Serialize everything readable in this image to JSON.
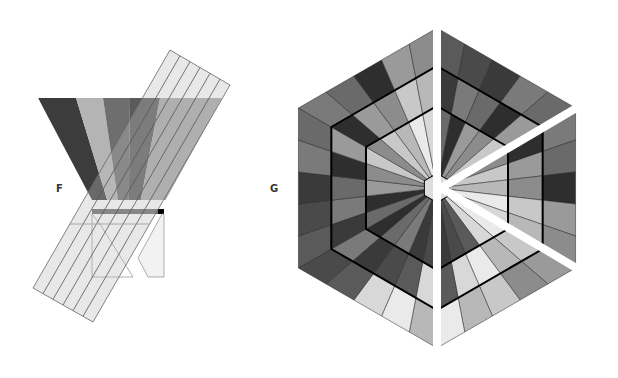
{
  "figure_f": {
    "label": "F",
    "triangle": {
      "top_left": [
        38,
        98
      ],
      "top_right": [
        222,
        98
      ],
      "apex": [
        92,
        190
      ],
      "bands": [
        {
          "x0": 38,
          "x1": 76,
          "color": "#3c3c3c"
        },
        {
          "x0": 76,
          "x1": 103,
          "color": "#b4b4b4"
        },
        {
          "x0": 103,
          "x1": 130,
          "color": "#6e6e6e"
        },
        {
          "x0": 130,
          "x1": 160,
          "color": "#5a5a5a"
        },
        {
          "x0": 160,
          "x1": 222,
          "color": "#a8a8a8"
        }
      ]
    },
    "strip_bar": {
      "x": 92,
      "y": 209,
      "w": 72,
      "h": 5,
      "color": "#6a6a6a"
    },
    "strips": 6
  },
  "figure_g": {
    "label": "G",
    "center": [
      437,
      188
    ],
    "radii": [
      160,
      122,
      82,
      14
    ],
    "rays_per_sector": 5,
    "colors": [
      "#5a5a5a",
      "#8c8c8c",
      "#3a3a3a",
      "#b8b8b8",
      "#6a6a6a",
      "#d8d8d8",
      "#9a9a9a",
      "#4a4a4a",
      "#c8c8c8",
      "#7a7a7a",
      "#eaeaea",
      "#2e2e2e"
    ]
  }
}
